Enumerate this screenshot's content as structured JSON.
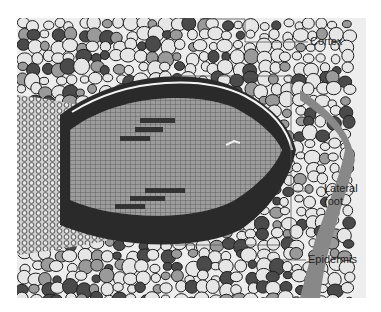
{
  "figure": {
    "labels": {
      "cortex": "Cortex",
      "lateral_root_line1": "Lateral",
      "lateral_root_line2": "root",
      "epidermis": "Epidermis"
    },
    "colors": {
      "background": "#ffffff",
      "photo_background": "#eeeeee",
      "cell_wall": "#1e1e1e",
      "cell_light": "#e6e6e6",
      "cell_mid": "#9a9a9a",
      "cell_dark": "#4a4a4a",
      "root_tissue": "#8a8a8a",
      "endodermis_band": "#2a2a2a",
      "leader_line": "#555555",
      "label_text": "#222222"
    }
  }
}
